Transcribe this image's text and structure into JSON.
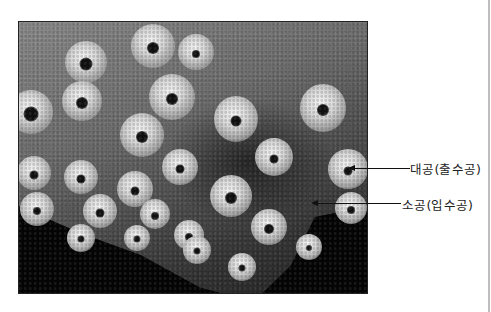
{
  "figure": {
    "labels": [
      {
        "text": "대공(출수공)",
        "target": "osculum"
      },
      {
        "text": "소공(입수공)",
        "target": "ostium"
      }
    ]
  },
  "colors": {
    "background": "#ffffff",
    "text": "#222222",
    "arrow": "#111111",
    "rule": "#bdbdbd"
  }
}
